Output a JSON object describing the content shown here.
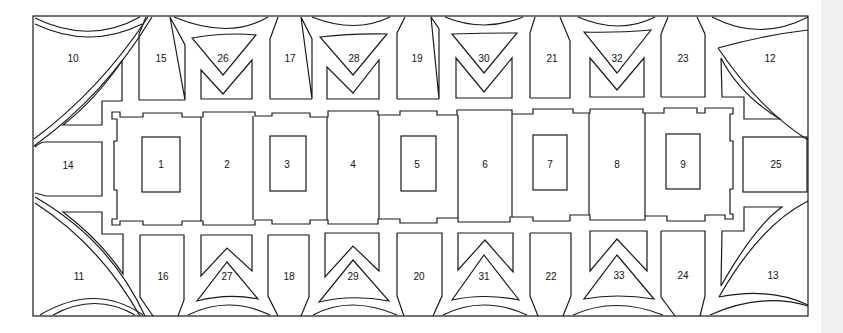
{
  "diagram": {
    "type": "site-plan",
    "stroke_color": "#1a1a1a",
    "background_color": "#ffffff",
    "central_row": [
      {
        "id": "1",
        "x": 161,
        "y": 164
      },
      {
        "id": "2",
        "x": 227,
        "y": 164
      },
      {
        "id": "3",
        "x": 287,
        "y": 164
      },
      {
        "id": "4",
        "x": 353,
        "y": 164
      },
      {
        "id": "5",
        "x": 417,
        "y": 164
      },
      {
        "id": "6",
        "x": 485,
        "y": 164
      },
      {
        "id": "7",
        "x": 550,
        "y": 164
      },
      {
        "id": "8",
        "x": 617,
        "y": 164
      },
      {
        "id": "9",
        "x": 683,
        "y": 164
      }
    ],
    "corners": [
      {
        "id": "10",
        "x": 73,
        "y": 58
      },
      {
        "id": "11",
        "x": 79,
        "y": 276
      },
      {
        "id": "12",
        "x": 770,
        "y": 58
      },
      {
        "id": "13",
        "x": 773,
        "y": 275
      }
    ],
    "ends": [
      {
        "id": "14",
        "x": 68,
        "y": 165
      },
      {
        "id": "25",
        "x": 776,
        "y": 164
      }
    ],
    "top_row": [
      {
        "id": "15",
        "x": 161,
        "y": 58
      },
      {
        "id": "26",
        "x": 223,
        "y": 58
      },
      {
        "id": "17",
        "x": 290,
        "y": 58
      },
      {
        "id": "28",
        "x": 354,
        "y": 58
      },
      {
        "id": "19",
        "x": 417,
        "y": 58
      },
      {
        "id": "30",
        "x": 484,
        "y": 58
      },
      {
        "id": "21",
        "x": 552,
        "y": 58
      },
      {
        "id": "32",
        "x": 617,
        "y": 58
      },
      {
        "id": "23",
        "x": 683,
        "y": 58
      }
    ],
    "bottom_row": [
      {
        "id": "16",
        "x": 163,
        "y": 276
      },
      {
        "id": "27",
        "x": 227,
        "y": 276
      },
      {
        "id": "18",
        "x": 289,
        "y": 276
      },
      {
        "id": "29",
        "x": 353,
        "y": 276
      },
      {
        "id": "20",
        "x": 419,
        "y": 276
      },
      {
        "id": "31",
        "x": 484,
        "y": 276
      },
      {
        "id": "22",
        "x": 551,
        "y": 276
      },
      {
        "id": "33",
        "x": 619,
        "y": 275
      },
      {
        "id": "24",
        "x": 683,
        "y": 275
      }
    ]
  }
}
